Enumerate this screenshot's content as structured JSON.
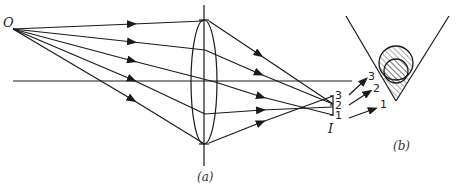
{
  "figure": {
    "panel_a": {
      "caption": "(a)",
      "object_label": "O",
      "image_label": "I",
      "image_points": [
        "3",
        "2",
        "1"
      ]
    },
    "panel_b": {
      "caption": "(b)",
      "ray_labels": [
        "3",
        "2",
        "1"
      ]
    }
  },
  "colors": {
    "ink": "#1a1a1a",
    "background": "#ffffff"
  }
}
